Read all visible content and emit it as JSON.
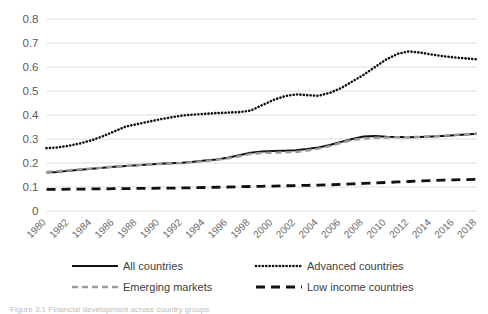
{
  "figure": {
    "caption": "Figure 3.1 Financial development across country groups"
  },
  "chart_data": {
    "type": "line",
    "title": "",
    "xlabel": "",
    "ylabel": "",
    "xlim": [
      1980,
      2018
    ],
    "ylim": [
      0,
      0.8
    ],
    "grid": true,
    "legend_position": "bottom",
    "ytick_labels": [
      "0.8",
      "0.7",
      "0.6",
      "0.5",
      "0.4",
      "0.3",
      "0.2",
      "0.1",
      "0"
    ],
    "ytick_values": [
      0.8,
      0.7,
      0.6,
      0.5,
      0.4,
      0.3,
      0.2,
      0.1,
      0
    ],
    "xtick_labels": [
      "1980",
      "1982",
      "1984",
      "1986",
      "1988",
      "1990",
      "1992",
      "1994",
      "1996",
      "1998",
      "2000",
      "2002",
      "2004",
      "2006",
      "2008",
      "2010",
      "2012",
      "2014",
      "2016",
      "2018"
    ],
    "x": [
      1980,
      1981,
      1982,
      1983,
      1984,
      1985,
      1986,
      1987,
      1988,
      1989,
      1990,
      1991,
      1992,
      1993,
      1994,
      1995,
      1996,
      1997,
      1998,
      1999,
      2000,
      2001,
      2002,
      2003,
      2004,
      2005,
      2006,
      2007,
      2008,
      2009,
      2010,
      2011,
      2012,
      2013,
      2014,
      2015,
      2016,
      2017,
      2018
    ],
    "series": [
      {
        "name": "All countries",
        "style": "solid",
        "color": "#111111",
        "values": [
          0.16,
          0.163,
          0.168,
          0.172,
          0.176,
          0.18,
          0.184,
          0.188,
          0.191,
          0.194,
          0.197,
          0.199,
          0.201,
          0.205,
          0.21,
          0.215,
          0.222,
          0.232,
          0.243,
          0.248,
          0.25,
          0.251,
          0.253,
          0.258,
          0.265,
          0.275,
          0.288,
          0.3,
          0.31,
          0.312,
          0.309,
          0.308,
          0.307,
          0.308,
          0.31,
          0.313,
          0.316,
          0.319,
          0.322
        ]
      },
      {
        "name": "Advanced countries",
        "style": "dotted",
        "color": "#111111",
        "values": [
          0.262,
          0.265,
          0.272,
          0.282,
          0.295,
          0.312,
          0.332,
          0.352,
          0.362,
          0.372,
          0.382,
          0.39,
          0.398,
          0.402,
          0.405,
          0.408,
          0.41,
          0.412,
          0.418,
          0.44,
          0.462,
          0.478,
          0.486,
          0.483,
          0.48,
          0.492,
          0.512,
          0.54,
          0.568,
          0.6,
          0.632,
          0.655,
          0.665,
          0.66,
          0.652,
          0.645,
          0.64,
          0.636,
          0.632
        ]
      },
      {
        "name": "Emerging markets",
        "style": "dashed",
        "color": "#9a9a9a",
        "values": [
          0.163,
          0.166,
          0.17,
          0.174,
          0.177,
          0.181,
          0.185,
          0.188,
          0.191,
          0.194,
          0.196,
          0.198,
          0.2,
          0.204,
          0.208,
          0.213,
          0.219,
          0.228,
          0.238,
          0.242,
          0.243,
          0.244,
          0.246,
          0.252,
          0.26,
          0.27,
          0.284,
          0.296,
          0.302,
          0.305,
          0.306,
          0.307,
          0.308,
          0.309,
          0.311,
          0.314,
          0.317,
          0.32,
          0.323
        ]
      },
      {
        "name": "Low income countries",
        "style": "longdash",
        "color": "#111111",
        "values": [
          0.09,
          0.09,
          0.091,
          0.091,
          0.092,
          0.092,
          0.093,
          0.093,
          0.094,
          0.094,
          0.095,
          0.095,
          0.096,
          0.097,
          0.098,
          0.099,
          0.1,
          0.101,
          0.102,
          0.103,
          0.104,
          0.105,
          0.106,
          0.107,
          0.108,
          0.109,
          0.111,
          0.113,
          0.115,
          0.117,
          0.119,
          0.121,
          0.123,
          0.125,
          0.127,
          0.129,
          0.13,
          0.131,
          0.132
        ]
      }
    ]
  },
  "legend": {
    "items": [
      {
        "label": "All countries",
        "style": "solid",
        "color": "#111111"
      },
      {
        "label": "Advanced countries",
        "style": "dotted",
        "color": "#111111"
      },
      {
        "label": "Emerging markets",
        "style": "dashed",
        "color": "#9a9a9a"
      },
      {
        "label": "Low income countries",
        "style": "longdash",
        "color": "#111111"
      }
    ]
  }
}
